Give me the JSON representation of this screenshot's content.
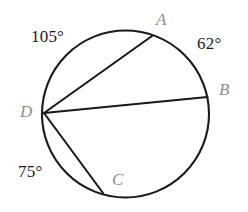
{
  "figure": {
    "type": "circle-geometry-diagram",
    "colors": {
      "stroke": "#1a1a1a",
      "point_label": "#8d8d8d",
      "arc_label": "#1a1a1a",
      "background": "#ffffff"
    },
    "circle": {
      "center_x": 125.5,
      "center_y": 114,
      "radius": 84
    },
    "points": [
      {
        "name": "A",
        "label": "A",
        "x": 152,
        "y": 36,
        "label_x": 156,
        "label_y": 11
      },
      {
        "name": "B",
        "label": "B",
        "x": 207,
        "y": 97,
        "label_x": 219,
        "label_y": 81
      },
      {
        "name": "C",
        "label": "C",
        "x": 103,
        "y": 193,
        "label_x": 112,
        "label_y": 171
      },
      {
        "name": "D",
        "label": "D",
        "x": 44,
        "y": 113,
        "label_x": 20,
        "label_y": 103
      }
    ],
    "chords": [
      {
        "name": "chord-DA",
        "from": "D",
        "to": "A"
      },
      {
        "name": "chord-DB",
        "from": "D",
        "to": "B"
      },
      {
        "name": "chord-DC",
        "from": "D",
        "to": "C"
      }
    ],
    "arc_labels": [
      {
        "name": "arc-DA-measure",
        "value": "105",
        "text": "105°",
        "x": 31,
        "y": 28
      },
      {
        "name": "arc-AB-measure",
        "value": "62",
        "text": "62°",
        "x": 197,
        "y": 35
      },
      {
        "name": "arc-CD-measure",
        "value": "75",
        "text": "75°",
        "x": 18,
        "y": 163
      }
    ]
  }
}
